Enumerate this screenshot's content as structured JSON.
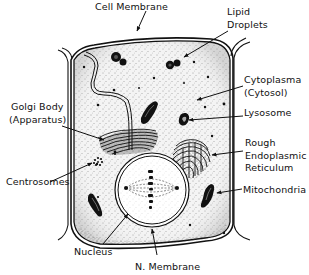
{
  "diagram": {
    "colors": {
      "ink": "#111111",
      "background": "#ffffff",
      "stipple": "#555555"
    },
    "labels": {
      "cell_membrane": "Cell Membrane",
      "lipid_droplets": [
        "Lipid",
        "Droplets"
      ],
      "cytoplasma": [
        "Cytoplasma",
        "(Cytosol)"
      ],
      "lysosome": "Lysosome",
      "rough_er": [
        "Rough",
        "Endoplasmic",
        "Reticulum"
      ],
      "mitochondria": "Mitochondria",
      "golgi_body": [
        "Golgi Body",
        "(Apparatus)"
      ],
      "centrosomes": "Centrosomes",
      "nucleus": "Nucleus",
      "nuclear_membrane": "N. Membrane"
    }
  }
}
